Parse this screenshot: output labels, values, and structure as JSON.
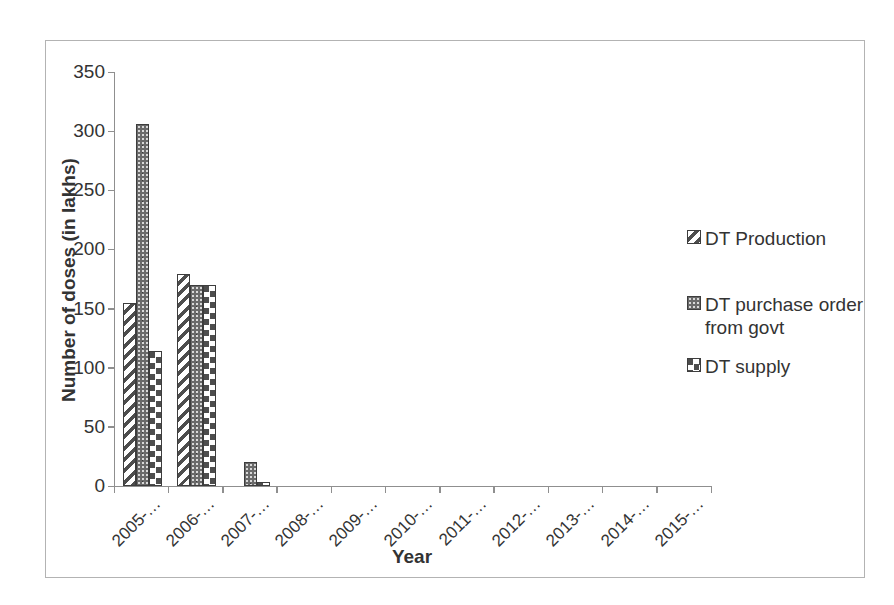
{
  "chart_data": {
    "type": "bar",
    "xlabel": "Year",
    "ylabel": "Number of doses (in lakhs)",
    "ylim": [
      0,
      350
    ],
    "ytick_interval": 50,
    "yticks": [
      350,
      300,
      250,
      200,
      150,
      100,
      50,
      0
    ],
    "categories": [
      "2005-…",
      "2006-…",
      "2007-…",
      "2008-…",
      "2009-…",
      "2010-…",
      "2011-…",
      "2012-…",
      "2013-…",
      "2014-…",
      "2015-…"
    ],
    "series": [
      {
        "name": "DT Production",
        "pattern": "diagonal-stripes",
        "values": [
          155,
          179,
          0,
          0,
          0,
          0,
          0,
          0,
          0,
          0,
          0
        ]
      },
      {
        "name": "DT purchase order from govt",
        "pattern": "dots",
        "values": [
          306,
          170,
          20,
          0,
          0,
          0,
          0,
          0,
          0,
          0,
          0
        ]
      },
      {
        "name": "DT supply",
        "pattern": "checker",
        "values": [
          114,
          170,
          3,
          0,
          0,
          0,
          0,
          0,
          0,
          0,
          0
        ]
      }
    ],
    "legend": {
      "position": "right",
      "entries": [
        {
          "lines": [
            "DT Production"
          ],
          "pattern": "diagonal-stripes"
        },
        {
          "lines": [
            "DT purchase  order",
            "from govt"
          ],
          "pattern": "dots"
        },
        {
          "lines": [
            "DT supply"
          ],
          "pattern": "checker"
        }
      ]
    },
    "grid": "off",
    "colors": {
      "ink": "#333333",
      "axis": "#8f8f8f",
      "pattern_dark": "#4d4d4d",
      "frame_border": "#b3b3b3",
      "background": "#ffffff"
    }
  }
}
